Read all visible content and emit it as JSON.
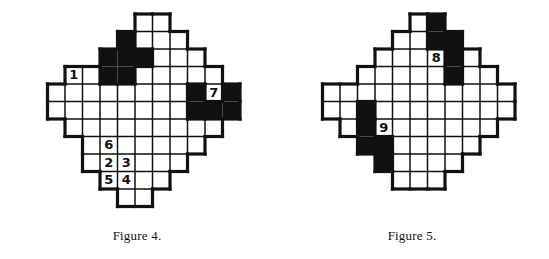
{
  "page": {
    "background_color": "#ffffff",
    "ink_color": "#111111",
    "width": 549,
    "height": 259
  },
  "figures": [
    {
      "id": "figure-4",
      "caption": "Figure 4.",
      "cell_size": 17.5,
      "origin_x": 30,
      "origin_y": 6,
      "cols": 12,
      "rows": 12,
      "description": "Diamond-shaped pixel grid puzzle with black and white cells and seven numbered white cells",
      "cells": [
        {
          "c": 6,
          "r": 0,
          "fill": "white"
        },
        {
          "c": 7,
          "r": 0,
          "fill": "white"
        },
        {
          "c": 5,
          "r": 1,
          "fill": "black"
        },
        {
          "c": 6,
          "r": 1,
          "fill": "white"
        },
        {
          "c": 7,
          "r": 1,
          "fill": "white"
        },
        {
          "c": 8,
          "r": 1,
          "fill": "white"
        },
        {
          "c": 4,
          "r": 2,
          "fill": "black"
        },
        {
          "c": 5,
          "r": 2,
          "fill": "black"
        },
        {
          "c": 6,
          "r": 2,
          "fill": "black"
        },
        {
          "c": 7,
          "r": 2,
          "fill": "white"
        },
        {
          "c": 8,
          "r": 2,
          "fill": "white"
        },
        {
          "c": 9,
          "r": 2,
          "fill": "white"
        },
        {
          "c": 2,
          "r": 3,
          "fill": "white",
          "label": "1"
        },
        {
          "c": 3,
          "r": 3,
          "fill": "white"
        },
        {
          "c": 4,
          "r": 3,
          "fill": "black"
        },
        {
          "c": 5,
          "r": 3,
          "fill": "black"
        },
        {
          "c": 6,
          "r": 3,
          "fill": "white"
        },
        {
          "c": 7,
          "r": 3,
          "fill": "white"
        },
        {
          "c": 8,
          "r": 3,
          "fill": "white"
        },
        {
          "c": 9,
          "r": 3,
          "fill": "white"
        },
        {
          "c": 10,
          "r": 3,
          "fill": "white"
        },
        {
          "c": 1,
          "r": 4,
          "fill": "white"
        },
        {
          "c": 2,
          "r": 4,
          "fill": "white"
        },
        {
          "c": 3,
          "r": 4,
          "fill": "white"
        },
        {
          "c": 4,
          "r": 4,
          "fill": "white"
        },
        {
          "c": 5,
          "r": 4,
          "fill": "white"
        },
        {
          "c": 6,
          "r": 4,
          "fill": "white"
        },
        {
          "c": 7,
          "r": 4,
          "fill": "white"
        },
        {
          "c": 8,
          "r": 4,
          "fill": "white"
        },
        {
          "c": 9,
          "r": 4,
          "fill": "black"
        },
        {
          "c": 10,
          "r": 4,
          "fill": "white",
          "label": "7"
        },
        {
          "c": 11,
          "r": 4,
          "fill": "black"
        },
        {
          "c": 1,
          "r": 5,
          "fill": "white"
        },
        {
          "c": 2,
          "r": 5,
          "fill": "white"
        },
        {
          "c": 3,
          "r": 5,
          "fill": "white"
        },
        {
          "c": 4,
          "r": 5,
          "fill": "white"
        },
        {
          "c": 5,
          "r": 5,
          "fill": "white"
        },
        {
          "c": 6,
          "r": 5,
          "fill": "white"
        },
        {
          "c": 7,
          "r": 5,
          "fill": "white"
        },
        {
          "c": 8,
          "r": 5,
          "fill": "white"
        },
        {
          "c": 9,
          "r": 5,
          "fill": "black"
        },
        {
          "c": 10,
          "r": 5,
          "fill": "black"
        },
        {
          "c": 11,
          "r": 5,
          "fill": "black"
        },
        {
          "c": 2,
          "r": 6,
          "fill": "white"
        },
        {
          "c": 3,
          "r": 6,
          "fill": "white"
        },
        {
          "c": 4,
          "r": 6,
          "fill": "white"
        },
        {
          "c": 5,
          "r": 6,
          "fill": "white"
        },
        {
          "c": 6,
          "r": 6,
          "fill": "white"
        },
        {
          "c": 7,
          "r": 6,
          "fill": "white"
        },
        {
          "c": 8,
          "r": 6,
          "fill": "white"
        },
        {
          "c": 9,
          "r": 6,
          "fill": "white"
        },
        {
          "c": 10,
          "r": 6,
          "fill": "white"
        },
        {
          "c": 3,
          "r": 7,
          "fill": "white"
        },
        {
          "c": 4,
          "r": 7,
          "fill": "white",
          "label": "6"
        },
        {
          "c": 5,
          "r": 7,
          "fill": "white"
        },
        {
          "c": 6,
          "r": 7,
          "fill": "white"
        },
        {
          "c": 7,
          "r": 7,
          "fill": "white"
        },
        {
          "c": 8,
          "r": 7,
          "fill": "white"
        },
        {
          "c": 9,
          "r": 7,
          "fill": "white"
        },
        {
          "c": 3,
          "r": 8,
          "fill": "white"
        },
        {
          "c": 4,
          "r": 8,
          "fill": "white",
          "label": "2"
        },
        {
          "c": 5,
          "r": 8,
          "fill": "white",
          "label": "3"
        },
        {
          "c": 6,
          "r": 8,
          "fill": "white"
        },
        {
          "c": 7,
          "r": 8,
          "fill": "white"
        },
        {
          "c": 8,
          "r": 8,
          "fill": "white"
        },
        {
          "c": 4,
          "r": 9,
          "fill": "white",
          "label": "5"
        },
        {
          "c": 5,
          "r": 9,
          "fill": "white",
          "label": "4"
        },
        {
          "c": 6,
          "r": 9,
          "fill": "white"
        },
        {
          "c": 7,
          "r": 9,
          "fill": "white"
        },
        {
          "c": 5,
          "r": 10,
          "fill": "white"
        },
        {
          "c": 6,
          "r": 10,
          "fill": "white"
        }
      ]
    },
    {
      "id": "figure-5",
      "caption": "Figure 5.",
      "cell_size": 17.5,
      "origin_x": 30,
      "origin_y": 6,
      "cols": 12,
      "rows": 12,
      "description": "Diamond-shaped pixel grid puzzle with black and white cells and two numbered white cells",
      "cells": [
        {
          "c": 6,
          "r": 0,
          "fill": "white"
        },
        {
          "c": 7,
          "r": 0,
          "fill": "black"
        },
        {
          "c": 5,
          "r": 1,
          "fill": "white"
        },
        {
          "c": 6,
          "r": 1,
          "fill": "white"
        },
        {
          "c": 7,
          "r": 1,
          "fill": "black"
        },
        {
          "c": 8,
          "r": 1,
          "fill": "black"
        },
        {
          "c": 4,
          "r": 2,
          "fill": "white"
        },
        {
          "c": 5,
          "r": 2,
          "fill": "white"
        },
        {
          "c": 6,
          "r": 2,
          "fill": "white"
        },
        {
          "c": 7,
          "r": 2,
          "fill": "white",
          "label": "8"
        },
        {
          "c": 8,
          "r": 2,
          "fill": "black"
        },
        {
          "c": 9,
          "r": 2,
          "fill": "white"
        },
        {
          "c": 3,
          "r": 3,
          "fill": "white"
        },
        {
          "c": 4,
          "r": 3,
          "fill": "white"
        },
        {
          "c": 5,
          "r": 3,
          "fill": "white"
        },
        {
          "c": 6,
          "r": 3,
          "fill": "white"
        },
        {
          "c": 7,
          "r": 3,
          "fill": "white"
        },
        {
          "c": 8,
          "r": 3,
          "fill": "black"
        },
        {
          "c": 9,
          "r": 3,
          "fill": "white"
        },
        {
          "c": 10,
          "r": 3,
          "fill": "white"
        },
        {
          "c": 1,
          "r": 4,
          "fill": "white"
        },
        {
          "c": 2,
          "r": 4,
          "fill": "white"
        },
        {
          "c": 3,
          "r": 4,
          "fill": "white"
        },
        {
          "c": 4,
          "r": 4,
          "fill": "white"
        },
        {
          "c": 5,
          "r": 4,
          "fill": "white"
        },
        {
          "c": 6,
          "r": 4,
          "fill": "white"
        },
        {
          "c": 7,
          "r": 4,
          "fill": "white"
        },
        {
          "c": 8,
          "r": 4,
          "fill": "white"
        },
        {
          "c": 9,
          "r": 4,
          "fill": "white"
        },
        {
          "c": 10,
          "r": 4,
          "fill": "white"
        },
        {
          "c": 11,
          "r": 4,
          "fill": "white"
        },
        {
          "c": 1,
          "r": 5,
          "fill": "white"
        },
        {
          "c": 2,
          "r": 5,
          "fill": "white"
        },
        {
          "c": 3,
          "r": 5,
          "fill": "black"
        },
        {
          "c": 4,
          "r": 5,
          "fill": "white"
        },
        {
          "c": 5,
          "r": 5,
          "fill": "white"
        },
        {
          "c": 6,
          "r": 5,
          "fill": "white"
        },
        {
          "c": 7,
          "r": 5,
          "fill": "white"
        },
        {
          "c": 8,
          "r": 5,
          "fill": "white"
        },
        {
          "c": 9,
          "r": 5,
          "fill": "white"
        },
        {
          "c": 10,
          "r": 5,
          "fill": "white"
        },
        {
          "c": 11,
          "r": 5,
          "fill": "white"
        },
        {
          "c": 2,
          "r": 6,
          "fill": "white"
        },
        {
          "c": 3,
          "r": 6,
          "fill": "black"
        },
        {
          "c": 4,
          "r": 6,
          "fill": "white",
          "label": "9"
        },
        {
          "c": 5,
          "r": 6,
          "fill": "white"
        },
        {
          "c": 6,
          "r": 6,
          "fill": "white"
        },
        {
          "c": 7,
          "r": 6,
          "fill": "white"
        },
        {
          "c": 8,
          "r": 6,
          "fill": "white"
        },
        {
          "c": 9,
          "r": 6,
          "fill": "white"
        },
        {
          "c": 10,
          "r": 6,
          "fill": "white"
        },
        {
          "c": 3,
          "r": 7,
          "fill": "black"
        },
        {
          "c": 4,
          "r": 7,
          "fill": "black"
        },
        {
          "c": 5,
          "r": 7,
          "fill": "white"
        },
        {
          "c": 6,
          "r": 7,
          "fill": "white"
        },
        {
          "c": 7,
          "r": 7,
          "fill": "white"
        },
        {
          "c": 8,
          "r": 7,
          "fill": "white"
        },
        {
          "c": 9,
          "r": 7,
          "fill": "white"
        },
        {
          "c": 4,
          "r": 8,
          "fill": "black"
        },
        {
          "c": 5,
          "r": 8,
          "fill": "white"
        },
        {
          "c": 6,
          "r": 8,
          "fill": "white"
        },
        {
          "c": 7,
          "r": 8,
          "fill": "white"
        },
        {
          "c": 8,
          "r": 8,
          "fill": "white"
        },
        {
          "c": 5,
          "r": 9,
          "fill": "white"
        },
        {
          "c": 6,
          "r": 9,
          "fill": "white"
        },
        {
          "c": 7,
          "r": 9,
          "fill": "white"
        }
      ]
    }
  ]
}
